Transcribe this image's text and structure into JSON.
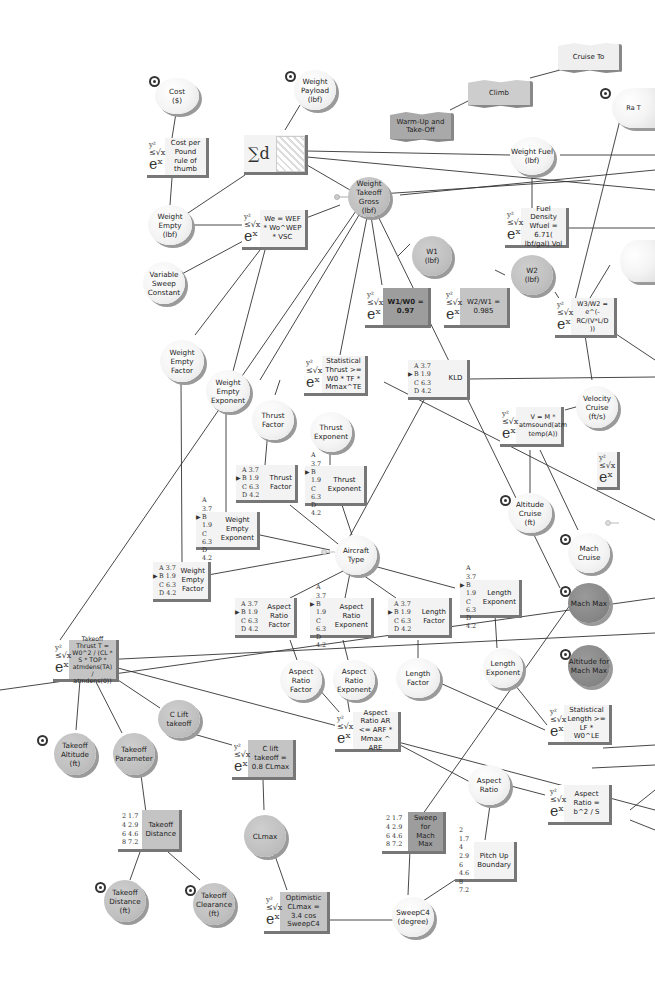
{
  "diagram": {
    "nodes": {
      "cost": {
        "label": "Cost\n($)"
      },
      "cost_per_pound": {
        "label": "Cost per Pound rule of thumb"
      },
      "weight_payload": {
        "label": "Weight\nPayload\n(lbf)"
      },
      "sum_d": {
        "label": "∑d"
      },
      "warmup_takeoff": {
        "label": "Warm-Up and Take-Off"
      },
      "climb": {
        "label": "Climb"
      },
      "cruise_to": {
        "label": "Cruise To"
      },
      "range_partial": {
        "label": "Ra T"
      },
      "weight_empty": {
        "label": "Weight Empty\n(lbf)"
      },
      "we_formula": {
        "label": "We = WEF * Wo^WEP * VSC"
      },
      "weight_fuel": {
        "label": "Weight Fuel\n(lbf)"
      },
      "weight_takeoff_gross": {
        "label": "Weight\nTakeoff Gross\n(lbf)"
      },
      "fuel_density": {
        "label": "Fuel Density Wfuel = 6.71( lbf/gal) Vol"
      },
      "variable_sweep": {
        "label": "Variable\nSweep\nConstant"
      },
      "w1": {
        "label": "W1\n(lbf)"
      },
      "w1_w0": {
        "label": "W1/W0 =\n0.97"
      },
      "w2": {
        "label": "W2\n(lbf)"
      },
      "w2_w1": {
        "label": "W2/W1 =\n0.985"
      },
      "w3_w2": {
        "label": "W3/W2 = e^(-RC/(V*L/D ))"
      },
      "weight_empty_factor_c": {
        "label": "Weight Empty\nFactor"
      },
      "weight_empty_exponent_c": {
        "label": "Weight Empty\nExponent"
      },
      "statistical_thrust": {
        "label": "Statistical Thrust >= W0 * TF * Mmax^TE"
      },
      "kld": {
        "label": "KLD"
      },
      "velocity_cruise": {
        "label": "Velocity\nCruise\n(ft/s)"
      },
      "v_formula": {
        "label": "V = M * atmsound(atm temp(A))"
      },
      "thrust_factor_c": {
        "label": "Thrust Factor"
      },
      "thrust_exponent_c": {
        "label": "Thrust\nExponent"
      },
      "thrust_factor_t": {
        "label": "Thrust Factor"
      },
      "thrust_exponent_t": {
        "label": "Thrust\nExponent"
      },
      "altitude_cruise": {
        "label": "Altitude Cruise\n(ft)"
      },
      "mach_cruise": {
        "label": "Mach Cruise"
      },
      "weight_empty_exponent_t": {
        "label": "Weight Empty\nExponent"
      },
      "weight_empty_factor_t": {
        "label": "Weight Empty\nFactor"
      },
      "aircraft_type": {
        "label": "Aircraft Type"
      },
      "aspect_ratio_factor_t": {
        "label": "Aspect Ratio\nFactor"
      },
      "aspect_ratio_exponent_t": {
        "label": "Aspect Ratio\nExponent"
      },
      "length_factor_t": {
        "label": "Length Factor"
      },
      "length_exponent_t": {
        "label": "Length\nExponent"
      },
      "mach_max": {
        "label": "Mach Max"
      },
      "altitude_mach_max": {
        "label": "Altitude for\nMach Max"
      },
      "takeoff_thrust": {
        "label": "Takeoff Thrust T = W0^2 / (CL * S * TOP * atmdens(TA) / atmdens(0))"
      },
      "aspect_ratio_factor_c": {
        "label": "Aspect Ratio\nFactor"
      },
      "aspect_ratio_exponent_c": {
        "label": "Aspect Ratio\nExponent"
      },
      "length_factor_c": {
        "label": "Length Factor"
      },
      "length_exponent_c": {
        "label": "Length\nExponent"
      },
      "statistical_length": {
        "label": "Statistical Length >= LF * W0^LE"
      },
      "c_lift_takeoff": {
        "label": "C Lift takeoff"
      },
      "c_lift_formula": {
        "label": "C lift takeoff = 0.8 CLmax"
      },
      "aspect_ratio_formula": {
        "label": "Aspect Ratio AR <= ARF * Mmax ^ ARE"
      },
      "takeoff_altitude": {
        "label": "Takeoff\nAltitude\n(ft)"
      },
      "takeoff_parameter": {
        "label": "Takeoff\nParameter"
      },
      "aspect_ratio": {
        "label": "Aspect Ratio"
      },
      "aspect_ratio_b2": {
        "label": "Aspect Ratio = b^2 / S"
      },
      "takeoff_distance_t": {
        "label": "Takeoff\nDistance"
      },
      "clmax": {
        "label": "CLmax"
      },
      "sweep_mach_max": {
        "label": "Sweep for\nMach Max"
      },
      "pitch_up": {
        "label": "Pitch Up\nBoundary"
      },
      "takeoff_distance_c": {
        "label": "Takeoff\nDistance\n(ft)"
      },
      "takeoff_clearance": {
        "label": "Takeoff\nClearance\n(ft)"
      },
      "optimistic_clmax": {
        "label": "Optimistic CLmax = 3.4 cos SweepC4"
      },
      "sweepc4": {
        "label": "SweepC4\n(degree)"
      }
    },
    "letter_table": [
      "A 3.7",
      "B 1.9",
      "C 6.3",
      "D 4.2"
    ],
    "number_table": [
      "2  1.7",
      "4  2.9",
      "6  4.6",
      "8  7.2"
    ],
    "formula_icon": {
      "top": "y²",
      "mid": "≤√x",
      "bottom": "eˣ"
    }
  }
}
